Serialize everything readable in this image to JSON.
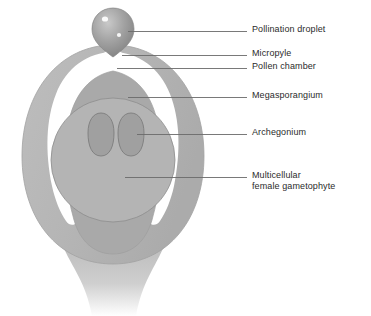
{
  "figure": {
    "background_color": "#ffffff",
    "text_color": "#2b2b2b",
    "leader_line_color": "#6a6a6a"
  },
  "palette": {
    "integument": "#b7b7b7",
    "integument_edge": "#a8a8a8",
    "megasporangium": "#a9a9a9",
    "pollen_chamber": "#ffffff",
    "gametophyte": "#b4b4b4",
    "gametophyte_edge": "#8d8d8d",
    "archegonium": "#a0a0a0",
    "archegonium_edge": "#7d7d7d",
    "droplet": "#9a9a9a",
    "droplet_highlight": "#ffffff",
    "stalk": "#bcbcbc"
  },
  "labels": [
    {
      "id": "pollination-droplet",
      "lines": [
        "Pollination droplet"
      ],
      "text": "Pollination droplet",
      "x": 252,
      "y": 24,
      "leader": {
        "x1": 128,
        "y1": 31,
        "x2": 247,
        "y2": 31
      }
    },
    {
      "id": "micropyle",
      "lines": [
        "Micropyle"
      ],
      "text": "Micropyle",
      "x": 252,
      "y": 48,
      "leader": {
        "x1": 122,
        "y1": 55,
        "x2": 247,
        "y2": 55
      }
    },
    {
      "id": "pollen-chamber",
      "lines": [
        "Pollen chamber"
      ],
      "text": "Pollen chamber",
      "x": 252,
      "y": 61,
      "leader": {
        "x1": 117,
        "y1": 68,
        "x2": 247,
        "y2": 68
      }
    },
    {
      "id": "megasporangium",
      "lines": [
        "Megasporangium"
      ],
      "text": "Megasporangium",
      "x": 252,
      "y": 90,
      "leader": {
        "x1": 128,
        "y1": 97,
        "x2": 247,
        "y2": 97
      }
    },
    {
      "id": "archegonium",
      "lines": [
        "Archegonium"
      ],
      "text": "Archegonium",
      "x": 252,
      "y": 127,
      "leader": {
        "x1": 137,
        "y1": 134,
        "x2": 247,
        "y2": 134
      }
    },
    {
      "id": "multicellular-female-gametophyte",
      "lines": [
        "Multicellular",
        "female gametophyte"
      ],
      "text": "Multicellular\nfemale gametophyte",
      "x": 252,
      "y": 170,
      "leader": {
        "x1": 125,
        "y1": 177,
        "x2": 247,
        "y2": 177
      }
    }
  ],
  "structures": {
    "droplet_label": "pollination droplet",
    "integument_label": "integument",
    "megasporangium_label": "megasporangium",
    "pollen_chamber_label": "pollen chamber",
    "gametophyte_label": "multicellular female gametophyte",
    "archegonium_left_label": "archegonium left",
    "archegonium_right_label": "archegonium right",
    "stalk_label": "ovule stalk"
  }
}
